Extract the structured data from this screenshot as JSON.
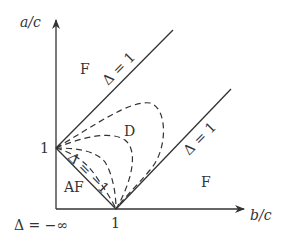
{
  "diagram": {
    "axes": {
      "y_label": "a/c",
      "x_label": "b/c",
      "y_tick": "1",
      "x_tick": "1"
    },
    "regions": {
      "ferro_upper": "F",
      "ferro_lower": "F",
      "disordered": "D",
      "antiferro": "AF"
    },
    "boundaries": {
      "upper_line": "Δ = 1",
      "lower_line": "Δ = 1",
      "af_line": "Δ = −1",
      "origin": "Δ = −∞"
    },
    "colors": {
      "ink": "#333333",
      "background": "#ffffff"
    }
  }
}
